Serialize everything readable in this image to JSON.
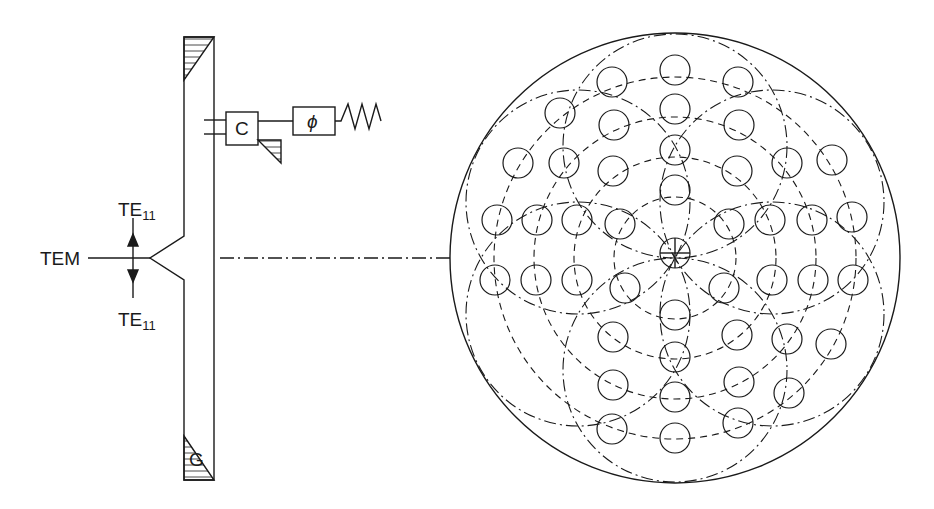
{
  "diagram": {
    "labels": {
      "input_mode": "TEM",
      "upper_mode": "TE",
      "upper_mode_sub": "11",
      "lower_mode": "TE",
      "lower_mode_sub": "11",
      "coupler": "C",
      "phase_shifter": "ϕ",
      "guide": "G"
    },
    "array": {
      "element_count": 49,
      "ring_style": "dashed",
      "subarray_style": "dash-dot"
    },
    "colors": {
      "stroke": "#1a1a1a",
      "background": "#ffffff"
    }
  }
}
